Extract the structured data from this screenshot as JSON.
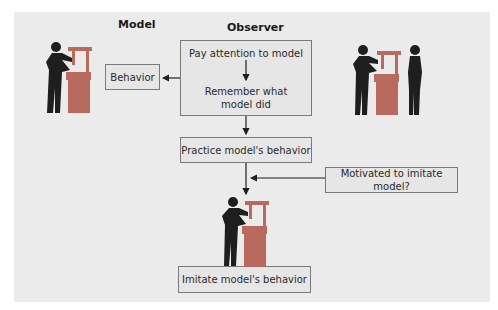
{
  "headings": {
    "model": "Model",
    "observer": "Observer"
  },
  "boxes": {
    "behavior": "Behavior",
    "observer_step1": "Pay attention to model",
    "observer_step2_line1": "Remember what",
    "observer_step2_line2": "model did",
    "practice": "Practice model's behavior",
    "motivated": "Motivated to imitate model?",
    "imitate": "Imitate model's behavior"
  },
  "icons": {
    "model_figure": "person-at-machine-icon",
    "observer_pair": "person-at-machine-with-observer-icon",
    "imitator_figure": "person-at-machine-icon"
  },
  "colors": {
    "panel": "#ebebeb",
    "figure": "#1e1e1e",
    "machine": "#b86a5e",
    "box_border": "#7a7a7a",
    "arrow": "#1e1e1e"
  }
}
